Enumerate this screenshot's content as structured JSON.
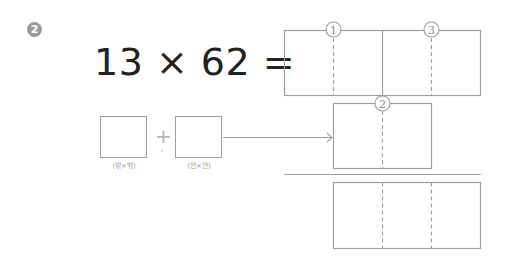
{
  "problem": {
    "number_badge": "2",
    "equation": "13 × 62 =",
    "step_labels": [
      "1",
      "2",
      "3"
    ]
  },
  "partial_products": {
    "operator": "+",
    "left_label": "(밖×밖)",
    "right_label": "(안×안)"
  },
  "colors": {
    "line": "#9e9e9e",
    "badge": "#9a9a9a",
    "text": "#222222"
  }
}
